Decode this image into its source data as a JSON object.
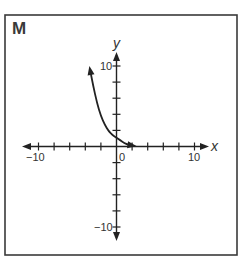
{
  "panel_label": "M",
  "axes": {
    "x_label": "x",
    "y_label": "y",
    "x_tick_labels": {
      "min": "−10",
      "origin": "0",
      "max": "10"
    },
    "y_tick_labels": {
      "max": "10",
      "min": "−10"
    }
  },
  "colors": {
    "ink": "#222222",
    "frame": "#3a3a3a",
    "background": "#ffffff"
  },
  "chart_data": {
    "type": "line",
    "title": "M",
    "xlabel": "x",
    "ylabel": "y",
    "xlim": [
      -10,
      10
    ],
    "ylim": [
      -10,
      10
    ],
    "x_ticks": [
      -10,
      -8,
      -6,
      -4,
      -2,
      0,
      2,
      4,
      6,
      8,
      10
    ],
    "y_ticks": [
      -10,
      -8,
      -6,
      -4,
      -2,
      0,
      2,
      4,
      6,
      8,
      10
    ],
    "x_tick_labels": [
      "-10",
      "0",
      "10"
    ],
    "y_tick_labels": [
      "10",
      "-10"
    ],
    "grid": false,
    "series": [
      {
        "name": "exponential decay curve",
        "arrows_both_ends": true,
        "x": [
          -3.3,
          -3,
          -2.5,
          -2,
          -1.5,
          -1,
          -0.5,
          0,
          0.5,
          1,
          1.5,
          2.3
        ],
        "y": [
          9.1,
          7.6,
          5.4,
          3.8,
          2.7,
          1.9,
          1.4,
          1.1,
          0.75,
          0.45,
          0.2,
          0.05
        ]
      }
    ]
  }
}
